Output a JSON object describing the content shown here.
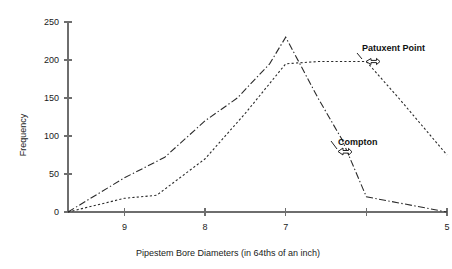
{
  "chart_data": {
    "type": "line",
    "title": "",
    "xlabel": "Pipestem Bore Diameters (in 64ths of an inch)",
    "ylabel": "Frequency",
    "x_tick_labels": [
      "9",
      "8",
      "7",
      "",
      "5"
    ],
    "x_tick_values": [
      9,
      8,
      7,
      6,
      5
    ],
    "x_axis_direction": "descending",
    "xlim": [
      9.7,
      5.0
    ],
    "y_tick_labels": [
      "0",
      "50",
      "100",
      "150",
      "200",
      "250"
    ],
    "y_tick_values": [
      0,
      50,
      100,
      150,
      200,
      250
    ],
    "ylim": [
      0,
      250
    ],
    "grid": false,
    "legend": "annotated-inline",
    "series": [
      {
        "name": "Compton",
        "style": "dash-dot",
        "color": "#2b2b2b",
        "x": [
          9.7,
          9.0,
          8.5,
          8.0,
          7.6,
          7.2,
          7.0,
          6.6,
          6.3,
          6.0,
          5.0
        ],
        "values": [
          0,
          45,
          72,
          120,
          150,
          195,
          230,
          150,
          95,
          20,
          0
        ]
      },
      {
        "name": "Patuxent Point",
        "style": "dotted",
        "color": "#2b2b2b",
        "x": [
          9.7,
          9.0,
          8.6,
          8.0,
          7.5,
          7.0,
          6.6,
          6.0,
          5.6,
          5.0
        ],
        "values": [
          0,
          18,
          22,
          70,
          130,
          195,
          198,
          198,
          150,
          75
        ]
      }
    ],
    "annotations": [
      {
        "text": "Patuxent Point",
        "series": "Patuxent Point",
        "marker": "left-arrow-callout"
      },
      {
        "text": "Compton",
        "series": "Compton",
        "marker": "left-arrow-callout"
      }
    ]
  },
  "axis": {
    "y_title": "Frequency",
    "x_title": "Pipestem Bore Diameters (in 64ths of an inch)"
  },
  "labels": {
    "patuxent": "Patuxent Point",
    "compton": "Compton"
  }
}
